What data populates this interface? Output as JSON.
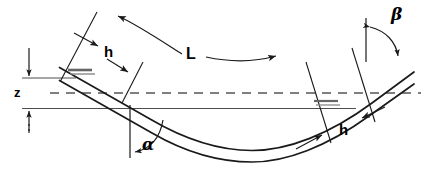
{
  "diagram": {
    "stroke_color": "#1a1a1a",
    "thin_stroke_color": "#4d4d4d",
    "dash_color": "#555555",
    "background": "#ffffff",
    "labels": {
      "h_left": "h",
      "h_right": "h",
      "span_L": "L",
      "depth_z": "z",
      "angle_alpha": "α",
      "angle_beta": "β"
    },
    "annotations": {
      "span_arrow": "double-headed curved arrow spanning L",
      "h_left_arrows": "pair of arrows marking thickness h at left end",
      "h_right_arrows": "pair of arrows marking thickness h at right end",
      "z_arrows": "vertical double arrow measuring z between dashed centerline and datum",
      "alpha_arc": "arc from vertical datum to conduit axis at left",
      "beta_arc": "arc from vertical datum to conduit axis at right"
    }
  }
}
